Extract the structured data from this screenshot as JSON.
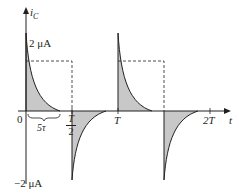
{
  "figure": {
    "y_axis_label": "i",
    "y_axis_subscript": "C",
    "x_axis_label": "t",
    "positive_peak_label": "2 μA",
    "negative_peak_label": "−2 μA",
    "origin_label": "0",
    "tau_label": "5τ",
    "half_period_numerator": "T",
    "half_period_denominator": "2",
    "period_label": "T",
    "double_period_label": "2T"
  },
  "colors": {
    "curve": "#231f20",
    "fill": "#c8c8c8",
    "axis": "#231f20",
    "dashed": "#231f20"
  }
}
